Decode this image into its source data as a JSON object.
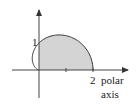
{
  "diagram": {
    "type": "polar-curve",
    "equation": "r = 1 + cos θ",
    "shaded_region": "first quadrant portion (0 ≤ θ ≤ π/2)",
    "axis_label_line1": "polar",
    "axis_label_line2": "axis",
    "tick_label_x": "2",
    "tick_label_y": "1",
    "colors": {
      "fill": "#d4d4d4",
      "stroke": "#333333",
      "axis": "#444444"
    }
  }
}
